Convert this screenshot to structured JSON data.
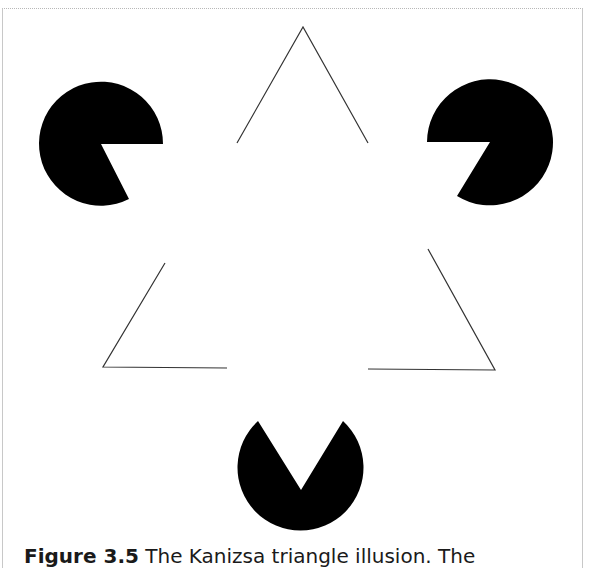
{
  "figure": {
    "title": "Kanizsa triangle illusion",
    "colors": {
      "background": "#ffffff",
      "pacman_fill": "#000000",
      "outline_stroke": "#333333",
      "frame_border": "#c0c0c0"
    },
    "pacmen": [
      {
        "name": "top-left",
        "cx": 101,
        "cy": 144,
        "r": 62,
        "mouth": "right-down"
      },
      {
        "name": "top-right",
        "cx": 490,
        "cy": 142,
        "r": 63,
        "mouth": "left-down"
      },
      {
        "name": "bottom",
        "cx": 301,
        "cy": 490,
        "r": 63,
        "mouth": "up"
      }
    ],
    "outline_triangle": {
      "apex": [
        303,
        27
      ],
      "bottom_left": [
        103,
        367
      ],
      "bottom_right": [
        495,
        370
      ]
    }
  },
  "caption": {
    "label": "Figure 3.5",
    "text": "The Kanizsa triangle illusion. The"
  }
}
